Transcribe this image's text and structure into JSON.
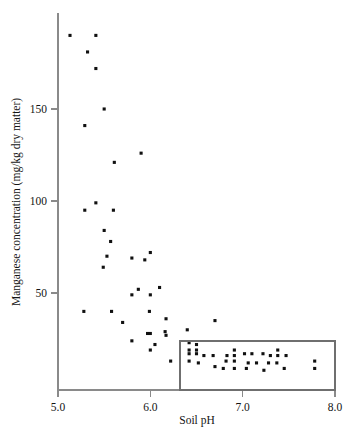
{
  "chart_data": {
    "type": "scatter",
    "title": "",
    "xlabel": "Soil pH",
    "ylabel": "Manganese concentration (mg/kg dry matter)",
    "xlim": [
      5.0,
      8.0
    ],
    "ylim": [
      0,
      196
    ],
    "xticks": [
      5.0,
      6.0,
      7.0,
      8.0
    ],
    "xtick_labels": [
      "5.0",
      "6.0",
      "7.0",
      "8.0"
    ],
    "yticks": [
      50,
      100,
      150
    ],
    "ytick_labels": [
      "50",
      "100",
      "150"
    ],
    "grid": false,
    "legend": null,
    "marker": "square",
    "marker_color": "#101010",
    "annotation_box": {
      "label": "highlight-rectangle",
      "x_range": [
        6.32,
        8.0
      ],
      "y_range": [
        0,
        24
      ],
      "stroke_color": "#6f6f6f"
    },
    "points": [
      {
        "x": 5.13,
        "y": 190
      },
      {
        "x": 5.41,
        "y": 190
      },
      {
        "x": 5.32,
        "y": 181
      },
      {
        "x": 5.41,
        "y": 172
      },
      {
        "x": 5.5,
        "y": 150
      },
      {
        "x": 5.29,
        "y": 141
      },
      {
        "x": 5.9,
        "y": 126
      },
      {
        "x": 5.61,
        "y": 121
      },
      {
        "x": 5.41,
        "y": 99
      },
      {
        "x": 5.29,
        "y": 95
      },
      {
        "x": 5.6,
        "y": 95
      },
      {
        "x": 5.5,
        "y": 84
      },
      {
        "x": 5.57,
        "y": 78
      },
      {
        "x": 6.0,
        "y": 72
      },
      {
        "x": 5.53,
        "y": 70
      },
      {
        "x": 5.8,
        "y": 69
      },
      {
        "x": 5.94,
        "y": 68
      },
      {
        "x": 5.49,
        "y": 64
      },
      {
        "x": 6.1,
        "y": 53
      },
      {
        "x": 5.87,
        "y": 52
      },
      {
        "x": 5.8,
        "y": 49
      },
      {
        "x": 6.0,
        "y": 49
      },
      {
        "x": 5.28,
        "y": 40
      },
      {
        "x": 5.58,
        "y": 40
      },
      {
        "x": 5.99,
        "y": 40
      },
      {
        "x": 6.17,
        "y": 36
      },
      {
        "x": 5.7,
        "y": 34
      },
      {
        "x": 6.7,
        "y": 35
      },
      {
        "x": 6.4,
        "y": 30
      },
      {
        "x": 6.16,
        "y": 29
      },
      {
        "x": 5.97,
        "y": 28
      },
      {
        "x": 6.0,
        "y": 28
      },
      {
        "x": 6.17,
        "y": 27
      },
      {
        "x": 5.8,
        "y": 24
      },
      {
        "x": 6.42,
        "y": 23
      },
      {
        "x": 6.05,
        "y": 22
      },
      {
        "x": 6.5,
        "y": 22
      },
      {
        "x": 6.0,
        "y": 19
      },
      {
        "x": 6.42,
        "y": 19
      },
      {
        "x": 6.5,
        "y": 19
      },
      {
        "x": 6.91,
        "y": 19
      },
      {
        "x": 7.38,
        "y": 19
      },
      {
        "x": 6.22,
        "y": 13
      },
      {
        "x": 6.42,
        "y": 17
      },
      {
        "x": 6.5,
        "y": 17
      },
      {
        "x": 6.58,
        "y": 16
      },
      {
        "x": 6.68,
        "y": 16
      },
      {
        "x": 6.83,
        "y": 16
      },
      {
        "x": 6.91,
        "y": 16
      },
      {
        "x": 7.02,
        "y": 17
      },
      {
        "x": 7.1,
        "y": 17
      },
      {
        "x": 7.22,
        "y": 17
      },
      {
        "x": 7.3,
        "y": 16
      },
      {
        "x": 7.38,
        "y": 16
      },
      {
        "x": 7.47,
        "y": 16
      },
      {
        "x": 6.42,
        "y": 13
      },
      {
        "x": 6.52,
        "y": 12
      },
      {
        "x": 6.82,
        "y": 13
      },
      {
        "x": 6.91,
        "y": 13
      },
      {
        "x": 7.06,
        "y": 12
      },
      {
        "x": 7.15,
        "y": 12
      },
      {
        "x": 7.28,
        "y": 12
      },
      {
        "x": 7.37,
        "y": 12
      },
      {
        "x": 7.78,
        "y": 13
      },
      {
        "x": 6.7,
        "y": 10
      },
      {
        "x": 6.79,
        "y": 9
      },
      {
        "x": 6.91,
        "y": 9
      },
      {
        "x": 7.04,
        "y": 9
      },
      {
        "x": 7.23,
        "y": 8
      },
      {
        "x": 7.45,
        "y": 9
      },
      {
        "x": 7.78,
        "y": 9
      }
    ]
  }
}
